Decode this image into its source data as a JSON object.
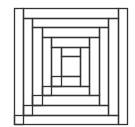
{
  "diagram": {
    "title": "",
    "kind": "log-cabin-quilt-block",
    "line_color": "#333333",
    "background": "#ffffff",
    "outer": [
      14,
      8,
      127,
      124
    ],
    "strips": [
      {
        "name": "left-outer",
        "rect": [
          14,
          8,
          23,
          124
        ]
      },
      {
        "name": "top-outer",
        "rect": [
          23,
          8,
          118,
          18
        ]
      },
      {
        "name": "right-outer",
        "rect": [
          118,
          8,
          127,
          124
        ]
      },
      {
        "name": "bottom-outer",
        "rect": [
          14,
          115,
          118,
          124
        ]
      },
      {
        "name": "left-2",
        "rect": [
          23,
          18,
          32,
          115
        ]
      },
      {
        "name": "top-2",
        "rect": [
          32,
          18,
          108,
          27
        ]
      },
      {
        "name": "right-2",
        "rect": [
          108,
          18,
          118,
          115
        ]
      },
      {
        "name": "bottom-2",
        "rect": [
          23,
          105,
          108,
          115
        ]
      },
      {
        "name": "left-3",
        "rect": [
          32,
          27,
          42,
          105
        ]
      },
      {
        "name": "top-3",
        "rect": [
          42,
          27,
          99,
          37
        ]
      },
      {
        "name": "right-3",
        "rect": [
          99,
          27,
          108,
          105
        ]
      },
      {
        "name": "bottom-3",
        "rect": [
          32,
          95,
          99,
          105
        ]
      },
      {
        "name": "left-4",
        "rect": [
          42,
          37,
          51,
          95
        ]
      },
      {
        "name": "top-4",
        "rect": [
          51,
          37,
          89,
          47
        ]
      },
      {
        "name": "right-4",
        "rect": [
          89,
          37,
          99,
          95
        ]
      },
      {
        "name": "bottom-4",
        "rect": [
          42,
          86,
          89,
          95
        ]
      },
      {
        "name": "left-5",
        "rect": [
          51,
          47,
          61,
          86
        ]
      },
      {
        "name": "top-5",
        "rect": [
          61,
          47,
          80,
          56
        ]
      },
      {
        "name": "right-5",
        "rect": [
          80,
          47,
          89,
          86
        ]
      },
      {
        "name": "bottom-5",
        "rect": [
          51,
          76,
          80,
          86
        ]
      },
      {
        "name": "center",
        "rect": [
          61,
          56,
          80,
          76
        ]
      }
    ]
  }
}
